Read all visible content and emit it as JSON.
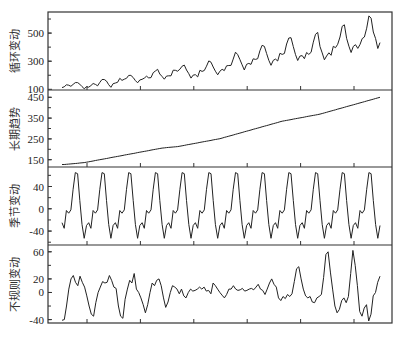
{
  "chart_data": [
    {
      "type": "line",
      "ylabel": "循环变动",
      "yticks": [
        100,
        300,
        500
      ],
      "ylim": [
        95,
        650
      ],
      "values": [
        112,
        118,
        132,
        129,
        121,
        135,
        148,
        148,
        136,
        119,
        104,
        118,
        115,
        126,
        141,
        135,
        125,
        149,
        170,
        170,
        158,
        133,
        114,
        140,
        145,
        150,
        178,
        163,
        172,
        178,
        199,
        199,
        184,
        162,
        146,
        166,
        171,
        180,
        193,
        181,
        183,
        218,
        230,
        242,
        209,
        191,
        172,
        194,
        196,
        196,
        236,
        235,
        229,
        243,
        264,
        272,
        237,
        211,
        180,
        201,
        204,
        188,
        235,
        227,
        234,
        264,
        302,
        293,
        259,
        229,
        203,
        229,
        242,
        233,
        267,
        269,
        270,
        315,
        364,
        347,
        312,
        274,
        237,
        278,
        284,
        277,
        317,
        313,
        318,
        374,
        413,
        405,
        355,
        306,
        271,
        306,
        315,
        301,
        356,
        348,
        355,
        422,
        465,
        467,
        404,
        347,
        305,
        336,
        340,
        318,
        362,
        348,
        363,
        435,
        491,
        505,
        404,
        359,
        310,
        337,
        360,
        342,
        406,
        396,
        420,
        472,
        548,
        559,
        463,
        407,
        362,
        405,
        417,
        391,
        419,
        461,
        472,
        535,
        622,
        606,
        508,
        461,
        390,
        432
      ]
    },
    {
      "type": "line",
      "ylabel": "长期趋势",
      "yticks": [
        150,
        250,
        350,
        450
      ],
      "ylim": [
        115,
        485
      ],
      "values": [
        127,
        127,
        128,
        129,
        130,
        131,
        132,
        133,
        134,
        135,
        136,
        138,
        140,
        142,
        144,
        146,
        148,
        150,
        152,
        154,
        156,
        158,
        160,
        162,
        164,
        166,
        168,
        170,
        172,
        174,
        176,
        178,
        180,
        182,
        184,
        186,
        188,
        190,
        192,
        194,
        196,
        198,
        200,
        202,
        204,
        206,
        207,
        208,
        209,
        210,
        211,
        212,
        213,
        215,
        217,
        219,
        221,
        223,
        225,
        227,
        229,
        231,
        233,
        235,
        237,
        239,
        241,
        243,
        245,
        247,
        249,
        251,
        254,
        257,
        260,
        263,
        266,
        269,
        272,
        275,
        278,
        281,
        284,
        287,
        290,
        293,
        296,
        299,
        302,
        305,
        308,
        311,
        314,
        317,
        320,
        323,
        326,
        329,
        332,
        335,
        337,
        339,
        341,
        343,
        345,
        347,
        349,
        351,
        353,
        355,
        357,
        359,
        361,
        363,
        365,
        367,
        369,
        372,
        375,
        378,
        381,
        384,
        387,
        390,
        393,
        396,
        399,
        402,
        405,
        408,
        411,
        414,
        417,
        420,
        423,
        426,
        429,
        432,
        435,
        438,
        441,
        444,
        447,
        450
      ]
    },
    {
      "type": "line",
      "ylabel": "季节变动",
      "yticks": [
        -40,
        0,
        40
      ],
      "ylim": [
        -65,
        75
      ],
      "pattern_per_year": [
        -25,
        -35,
        -3,
        -8,
        -2,
        35,
        65,
        63,
        15,
        -28,
        -53,
        -30
      ],
      "years": 12,
      "first_month_value": -28
    },
    {
      "type": "line",
      "ylabel": "不规则变动",
      "yticks": [
        -40,
        0,
        20,
        60
      ],
      "ylim": [
        -45,
        70
      ],
      "values": [
        -41,
        -40,
        -20,
        5,
        20,
        25,
        15,
        10,
        24,
        15,
        8,
        -5,
        -20,
        -32,
        -35,
        -15,
        0,
        8,
        16,
        14,
        15,
        25,
        18,
        8,
        6,
        -20,
        -35,
        -38,
        -10,
        5,
        18,
        14,
        28,
        5,
        0,
        -8,
        -18,
        -30,
        -18,
        0,
        14,
        10,
        18,
        20,
        10,
        -8,
        -22,
        -14,
        0,
        10,
        8,
        5,
        -2,
        5,
        -5,
        -8,
        0,
        5,
        2,
        3,
        5,
        8,
        5,
        8,
        2,
        3,
        -2,
        14,
        10,
        5,
        0,
        -4,
        -8,
        -3,
        5,
        5,
        10,
        5,
        3,
        4,
        6,
        2,
        3,
        5,
        6,
        4,
        8,
        12,
        5,
        3,
        -3,
        5,
        14,
        20,
        12,
        8,
        -8,
        -12,
        -6,
        -9,
        -3,
        -6,
        -2,
        16,
        35,
        38,
        20,
        5,
        -5,
        -8,
        -6,
        -14,
        -15,
        -8,
        -6,
        -3,
        22,
        56,
        60,
        30,
        5,
        -20,
        -30,
        -25,
        -12,
        -8,
        -15,
        -6,
        28,
        62,
        40,
        10,
        -28,
        -35,
        -23,
        -18,
        -42,
        -32,
        -5,
        0,
        15,
        24
      ]
    }
  ],
  "xticks_count": 6
}
